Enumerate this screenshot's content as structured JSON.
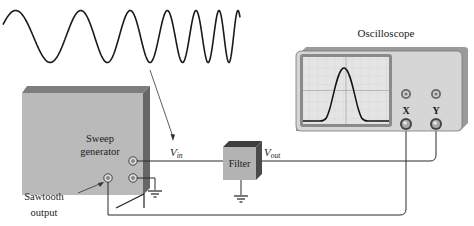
{
  "diagram": {
    "labels": {
      "sweep_generator_line1": "Sweep",
      "sweep_generator_line2": "generator",
      "sawtooth_line1": "Sawtooth",
      "sawtooth_line2": "output",
      "vin_main": "V",
      "vin_sub": "in",
      "vout_main": "V",
      "vout_sub": "out",
      "filter": "Filter",
      "oscilloscope": "Oscilloscope",
      "x_input": "X",
      "y_input": "Y"
    },
    "colors": {
      "box_face": "#b9b9b9",
      "box_top": "#7a7a7a",
      "box_side": "#6a6a6a",
      "scope_body": "#d4d4d4",
      "scope_screen": "#e6e6e6",
      "wire": "#222222"
    },
    "components": [
      {
        "id": "sweep-generator",
        "type": "signal-source"
      },
      {
        "id": "filter",
        "type": "device-under-test"
      },
      {
        "id": "oscilloscope",
        "type": "instrument",
        "inputs": [
          "X",
          "Y"
        ]
      }
    ],
    "connections": [
      {
        "from": "sweep-generator.output",
        "to": "filter.input",
        "signal": "Vin"
      },
      {
        "from": "filter.output",
        "to": "oscilloscope.Y",
        "signal": "Vout"
      },
      {
        "from": "sweep-generator.sawtooth",
        "to": "oscilloscope.X",
        "signal": "sawtooth"
      }
    ]
  }
}
